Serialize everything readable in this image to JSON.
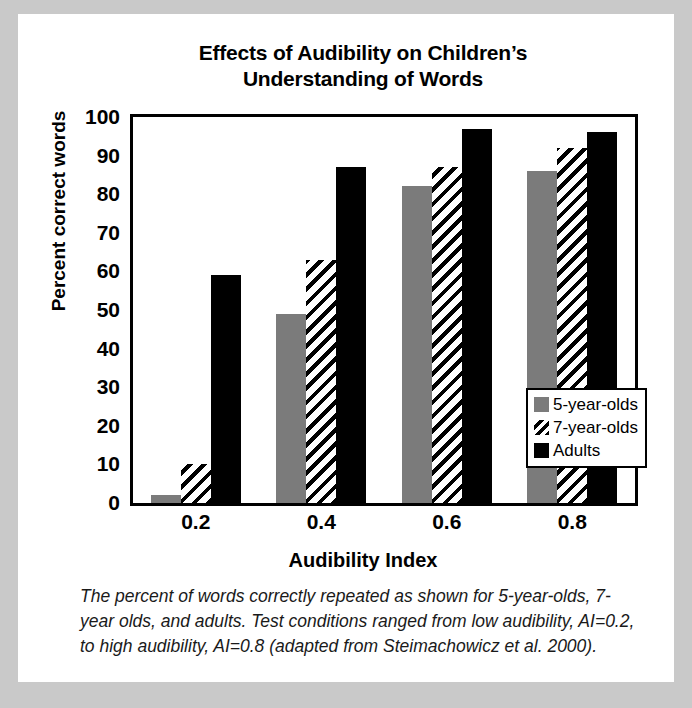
{
  "figure": {
    "title": "Effects of Audibility on Children’s Understanding of Words",
    "title_line1": "Effects of Audibility on Children’s",
    "title_line2": "Understanding of Words",
    "caption": "The percent of words correctly repeated as shown for 5-year-olds, 7-year olds, and adults. Test conditions ranged from low audibility, AI=0.2, to high audibility, AI=0.8 (adapted from Steimachowicz et al. 2000)."
  },
  "chart_data": {
    "type": "bar",
    "title": "Effects of Audibility on Children’s Understanding of Words",
    "xlabel": "Audibility Index",
    "ylabel": "Percent correct words",
    "categories": [
      "0.2",
      "0.4",
      "0.6",
      "0.8"
    ],
    "ylim": [
      0,
      100
    ],
    "yticks": [
      100,
      90,
      80,
      70,
      60,
      50,
      40,
      30,
      20,
      10,
      0
    ],
    "grid": false,
    "legend_position": "inside-right",
    "series": [
      {
        "name": "5-year-olds",
        "pattern": "solid-gray",
        "color": "#7b7b7b",
        "values": [
          2,
          49,
          82,
          86
        ]
      },
      {
        "name": "7-year-olds",
        "pattern": "diagonal-hatch",
        "color": "#ffffff",
        "values": [
          10,
          63,
          87,
          92
        ]
      },
      {
        "name": "Adults",
        "pattern": "solid-black",
        "color": "#000000",
        "values": [
          59,
          87,
          97,
          96
        ]
      }
    ]
  },
  "colors": {
    "page_border": "#c9c9c9",
    "sheet": "#ffffff",
    "axis": "#000000",
    "series_5yo": "#7b7b7b",
    "series_adults": "#000000"
  }
}
